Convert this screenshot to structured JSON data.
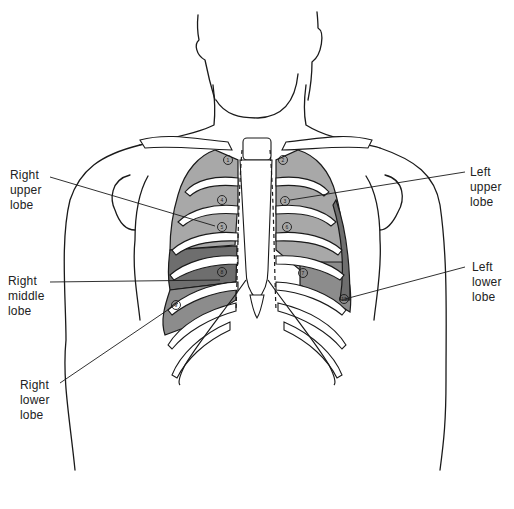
{
  "diagram": {
    "colors": {
      "outline": "#1a1a1a",
      "upper_lobe": "#a8a8a8",
      "middle_lobe": "#6e6e6e",
      "lower_lobe": "#8c8c8c",
      "bone": "#ffffff",
      "background": "#ffffff"
    },
    "labels": {
      "right_upper": [
        "Right",
        "upper",
        "lobe"
      ],
      "right_middle": [
        "Right",
        "middle",
        "lobe"
      ],
      "right_lower": [
        "Right",
        "lower",
        "lobe"
      ],
      "left_upper": [
        "Left",
        "upper",
        "lobe"
      ],
      "left_lower": [
        "Left",
        "lower",
        "lobe"
      ]
    },
    "markers": [
      {
        "id": "1",
        "x": 228,
        "y": 160
      },
      {
        "id": "2",
        "x": 283,
        "y": 160
      },
      {
        "id": "3",
        "x": 285,
        "y": 201
      },
      {
        "id": "4",
        "x": 222,
        "y": 200
      },
      {
        "id": "5",
        "x": 222,
        "y": 227
      },
      {
        "id": "6",
        "x": 287,
        "y": 227
      },
      {
        "id": "7",
        "x": 303,
        "y": 273
      },
      {
        "id": "8",
        "x": 222,
        "y": 272
      },
      {
        "id": "9",
        "x": 176,
        "y": 305
      },
      {
        "id": "10",
        "x": 344,
        "y": 299
      }
    ]
  }
}
